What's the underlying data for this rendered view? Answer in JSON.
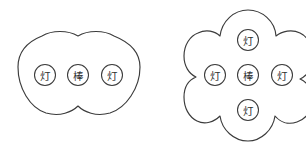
{
  "canvas": {
    "width": 306,
    "height": 151,
    "background_color": "#ffffff",
    "stroke_color": "#3b3b3b",
    "label_color": "#2e2e2e"
  },
  "diagrams": [
    {
      "id": "linear-cluster",
      "name": "three-lobe-linear-cluster",
      "outline_shape": "three-overlapping-circles-cloud",
      "lobe_count": 3,
      "bounds": {
        "x": 18,
        "y": 36,
        "width": 122,
        "height": 78
      },
      "nodes": [
        {
          "id": "left-lamp",
          "label": "灯",
          "cx": 45,
          "cy": 75,
          "r": 10.5
        },
        {
          "id": "center-rod",
          "label": "棒",
          "cx": 78,
          "cy": 75,
          "r": 10.5
        },
        {
          "id": "right-lamp",
          "label": "灯",
          "cx": 112,
          "cy": 75,
          "r": 10.5
        }
      ]
    },
    {
      "id": "cross-cluster",
      "name": "four-lobe-cross-cluster",
      "outline_shape": "four-overlapping-circles-flower",
      "lobe_count": 4,
      "clipped_edge": "right",
      "bounds": {
        "x": 190,
        "y": 10,
        "width": 126,
        "height": 131
      },
      "nodes": [
        {
          "id": "top-lamp",
          "label": "灯",
          "cx": 248,
          "cy": 40,
          "r": 10.5
        },
        {
          "id": "left-lamp",
          "label": "灯",
          "cx": 215,
          "cy": 75,
          "r": 10.5
        },
        {
          "id": "center-rod",
          "label": "棒",
          "cx": 248,
          "cy": 75,
          "r": 10.5
        },
        {
          "id": "right-lamp",
          "label": "灯",
          "cx": 282,
          "cy": 75,
          "r": 10.5
        },
        {
          "id": "bottom-lamp",
          "label": "灯",
          "cx": 248,
          "cy": 110,
          "r": 10.5
        }
      ]
    }
  ]
}
